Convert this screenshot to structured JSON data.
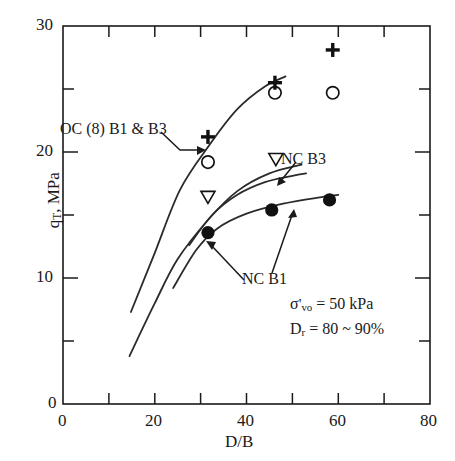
{
  "chart_data": {
    "type": "scatter",
    "title": "",
    "xlabel": "D/B",
    "ylabel": "q_T, MPa",
    "ylabel_display": "q",
    "ylabel_sub": "T",
    "ylabel_rest": ", MPa",
    "xlim": [
      0,
      80
    ],
    "ylim": [
      0,
      30
    ],
    "xticks": [
      0,
      10,
      20,
      30,
      40,
      50,
      60,
      70,
      80
    ],
    "yticks": [
      0,
      5,
      10,
      15,
      20,
      25,
      30
    ],
    "xtick_labels": [
      "0",
      "",
      "20",
      "",
      "40",
      "",
      "60",
      "",
      "80"
    ],
    "ytick_labels": [
      "0",
      "",
      "10",
      "",
      "20",
      "",
      "30"
    ],
    "grid": false,
    "legend": "none",
    "series": [
      {
        "name": "OC (8) B1 plus",
        "marker": "plus",
        "points": [
          {
            "x": 31.6,
            "y": 21.2
          },
          {
            "x": 46.2,
            "y": 25.5
          },
          {
            "x": 58.8,
            "y": 28.1
          }
        ]
      },
      {
        "name": "OC (8) B3 circle-open",
        "marker": "circle-open",
        "points": [
          {
            "x": 31.6,
            "y": 19.2
          },
          {
            "x": 46.2,
            "y": 24.7
          },
          {
            "x": 58.8,
            "y": 24.7
          }
        ]
      },
      {
        "name": "NC B3 triangle-down-open",
        "marker": "triangle-down-open",
        "points": [
          {
            "x": 31.6,
            "y": 16.4
          },
          {
            "x": 46.4,
            "y": 19.4
          }
        ]
      },
      {
        "name": "NC B1 circle-filled",
        "marker": "circle-filled",
        "points": [
          {
            "x": 31.6,
            "y": 13.6
          },
          {
            "x": 45.5,
            "y": 15.4
          },
          {
            "x": 58.1,
            "y": 16.2
          }
        ]
      }
    ],
    "curves": [
      {
        "name": "OC curve",
        "path": [
          [
            14.8,
            7.3
          ],
          [
            20.0,
            12.0
          ],
          [
            25.5,
            17.0
          ],
          [
            31.6,
            20.4
          ],
          [
            38.0,
            23.4
          ],
          [
            44.0,
            25.2
          ],
          [
            48.5,
            26.0
          ]
        ]
      },
      {
        "name": "NC B3 curve",
        "path": [
          [
            14.5,
            3.8
          ],
          [
            20.0,
            8.0
          ],
          [
            25.0,
            11.5
          ],
          [
            31.6,
            14.6
          ],
          [
            38.0,
            16.9
          ],
          [
            45.0,
            18.3
          ],
          [
            52.0,
            19.0
          ]
        ]
      },
      {
        "name": "NC B1 curve",
        "path": [
          [
            24.0,
            9.2
          ],
          [
            29.0,
            12.2
          ],
          [
            33.5,
            13.9
          ],
          [
            40.0,
            15.1
          ],
          [
            48.0,
            15.9
          ],
          [
            56.0,
            16.4
          ],
          [
            60.0,
            16.6
          ]
        ]
      },
      {
        "name": "NC upper curve",
        "path": [
          [
            27.5,
            12.6
          ],
          [
            32.5,
            15.0
          ],
          [
            38.0,
            16.6
          ],
          [
            44.0,
            17.6
          ],
          [
            50.0,
            18.1
          ],
          [
            53.0,
            18.3
          ]
        ]
      }
    ],
    "annotations": [
      {
        "name": "oc-label",
        "text": "OC (8) B1 & B3",
        "x": 17.5,
        "y": 22.9
      },
      {
        "name": "nc-b3-label",
        "text": "NC B3",
        "x": 47.0,
        "y": 21.3
      },
      {
        "name": "nc-b1-label",
        "text": "NC B1",
        "x": 35.5,
        "y": 10.6
      },
      {
        "name": "sigma-note",
        "text": "σ'vo = 50 kPa",
        "x": 46.0,
        "y": 6.2
      },
      {
        "name": "dr-note",
        "text": "Dr = 80 ~ 90%",
        "x": 46.0,
        "y": 4.5
      }
    ]
  },
  "labels": {
    "x_axis_title": "D/B",
    "y_axis_q": "q",
    "y_axis_sub": "T",
    "y_axis_unit": ", MPa",
    "oc_label": "OC (8) B1 & B3",
    "nc_b3_label": "NC B3",
    "nc_b1_label": "NC B1",
    "sigma_symbol": "σ",
    "sigma_prime": "'",
    "sigma_sub": "vo",
    "sigma_value": " = 50 kPa",
    "dr_symbol": "D",
    "dr_sub": "r",
    "dr_value": " = 80 ~ 90%",
    "x0": "0",
    "x20": "20",
    "x40": "40",
    "x60": "60",
    "x80": "80",
    "y0": "0",
    "y10": "10",
    "y20": "20",
    "y30": "30"
  },
  "colors": {
    "axis": "#1a1a1a",
    "marker": "#111111",
    "curve": "#2b2b2b",
    "background": "#ffffff"
  }
}
